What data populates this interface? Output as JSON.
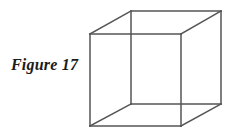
{
  "figure": {
    "caption": "Figure 17",
    "background_color": "#ffffff",
    "line_color": "#555555",
    "line_width": 1.5,
    "shape_name": "wireframe-cube",
    "canvas": {
      "width": 236,
      "height": 140
    },
    "vertices": {
      "front_top_left": [
        90,
        34
      ],
      "front_top_right": [
        181,
        34
      ],
      "front_bottom_right": [
        181,
        126
      ],
      "front_bottom_left": [
        90,
        126
      ],
      "back_top_left": [
        131,
        11
      ],
      "back_top_right": [
        221,
        11
      ],
      "back_bottom_right": [
        221,
        104
      ],
      "back_bottom_left": [
        131,
        104
      ]
    },
    "edges": [
      {
        "name": "front-top-edge",
        "from": "front_top_left",
        "to": "front_top_right"
      },
      {
        "name": "front-right-edge",
        "from": "front_top_right",
        "to": "front_bottom_right"
      },
      {
        "name": "front-bottom-edge",
        "from": "front_bottom_right",
        "to": "front_bottom_left"
      },
      {
        "name": "front-left-edge",
        "from": "front_bottom_left",
        "to": "front_top_left"
      },
      {
        "name": "back-top-edge",
        "from": "back_top_left",
        "to": "back_top_right"
      },
      {
        "name": "back-right-edge",
        "from": "back_top_right",
        "to": "back_bottom_right"
      },
      {
        "name": "back-bottom-edge",
        "from": "back_bottom_right",
        "to": "back_bottom_left"
      },
      {
        "name": "back-left-edge",
        "from": "back_bottom_left",
        "to": "back_top_left"
      },
      {
        "name": "connector-top-left",
        "from": "front_top_left",
        "to": "back_top_left"
      },
      {
        "name": "connector-top-right",
        "from": "front_top_right",
        "to": "back_top_right"
      },
      {
        "name": "connector-bottom-right",
        "from": "front_bottom_right",
        "to": "back_bottom_right"
      },
      {
        "name": "connector-bottom-left",
        "from": "front_bottom_left",
        "to": "back_bottom_left"
      }
    ]
  }
}
